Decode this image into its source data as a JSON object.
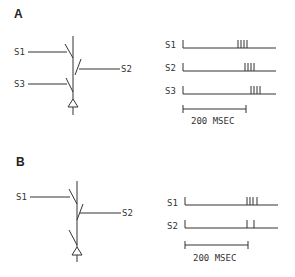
{
  "panels": [
    {
      "label": "A",
      "inputs": [
        "S1",
        "S2",
        "S3"
      ],
      "traces": [
        {
          "name": "S1",
          "spikes_ms": [
            174,
            184,
            193,
            203
          ]
        },
        {
          "name": "S2",
          "spikes_ms": [
            197,
            206,
            216,
            225
          ]
        },
        {
          "name": "S3",
          "spikes_ms": [
            216,
            225,
            235,
            244
          ]
        }
      ],
      "scale_bar": "200 MSEC"
    },
    {
      "label": "B",
      "inputs": [
        "S1",
        "S2"
      ],
      "traces": [
        {
          "name": "S1",
          "spikes_ms": [
            197,
            206,
            216,
            228
          ]
        },
        {
          "name": "S2",
          "spikes_ms": [
            197,
            219
          ]
        }
      ],
      "scale_bar": "200 MSEC"
    }
  ],
  "colors": {
    "line": "#333333",
    "background": "#ffffff"
  }
}
